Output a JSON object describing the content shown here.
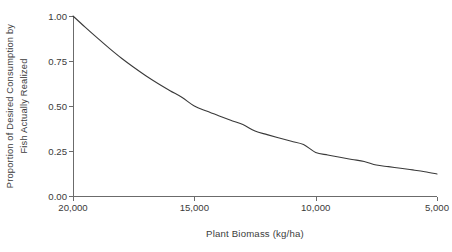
{
  "chart_data": {
    "type": "line",
    "title": "",
    "subtitle": "",
    "xlabel": "Plant Biomass (kg/ha)",
    "ylabel_line1": "Proportion of Desired Consumption by",
    "ylabel_line2": "Fish Actually Realized",
    "ylabel": "Proportion of Desired Consumption by Fish Actually Realized",
    "xlim": [
      20000,
      5000
    ],
    "ylim": [
      0.0,
      1.0
    ],
    "x_reversed": true,
    "grid": false,
    "legend": "none",
    "xticks": [
      20000,
      15000,
      10000,
      5000
    ],
    "xtick_labels": [
      "20,000",
      "15,000",
      "10,000",
      "5,000"
    ],
    "yticks": [
      0.0,
      0.25,
      0.5,
      0.75,
      1.0
    ],
    "ytick_labels": [
      "0.00",
      "0.25",
      "0.50",
      "0.75",
      "1.00"
    ],
    "series": [
      {
        "name": "Proportion realized",
        "color": "#3a3a3a",
        "line_width": 1.1,
        "x": [
          20000,
          19500,
          19000,
          18500,
          18000,
          17500,
          17000,
          16500,
          16000,
          15500,
          15000,
          14500,
          14000,
          13500,
          13000,
          12500,
          12000,
          11500,
          11000,
          10500,
          10000,
          9500,
          9000,
          8500,
          8000,
          7500,
          7000,
          6500,
          6000,
          5500,
          5000
        ],
        "y": [
          1.0,
          0.938,
          0.878,
          0.82,
          0.765,
          0.715,
          0.668,
          0.625,
          0.585,
          0.547,
          0.5,
          0.472,
          0.446,
          0.421,
          0.397,
          0.361,
          0.341,
          0.322,
          0.304,
          0.286,
          0.242,
          0.228,
          0.215,
          0.203,
          0.192,
          0.172,
          0.163,
          0.154,
          0.145,
          0.135,
          0.122
        ]
      }
    ],
    "annotations": []
  },
  "axis": {
    "line_color": "#6b6b6b",
    "tick_color": "#6b6b6b",
    "text_color": "#3a3a3a"
  }
}
